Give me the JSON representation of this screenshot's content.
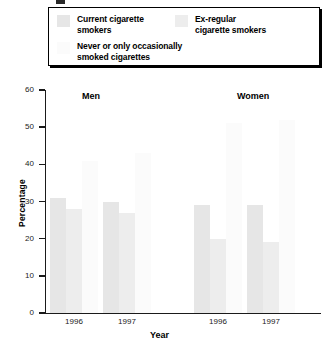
{
  "legend": {
    "items": [
      {
        "label": "Current cigarette\nsmokers",
        "color": "#e6e6e6",
        "name": "current-smokers"
      },
      {
        "label": "Ex-regular\ncigarette smokers",
        "color": "#ededed",
        "name": "ex-regular-smokers"
      },
      {
        "label": "Never or only occasionally\nsmoked cigarettes",
        "color": "#fbfbfb",
        "name": "never-smokers"
      }
    ]
  },
  "chart_data": {
    "type": "bar",
    "title": "",
    "xlabel": "Year",
    "ylabel": "Percentage",
    "ylim": [
      0,
      60
    ],
    "yticks": [
      0,
      10,
      20,
      30,
      40,
      50,
      60
    ],
    "grid": false,
    "legend_position": "top",
    "group_labels": [
      "Men",
      "Women"
    ],
    "categories": [
      "1996",
      "1997",
      "1996",
      "1997"
    ],
    "group_of_category": [
      "Men",
      "Men",
      "Women",
      "Women"
    ],
    "series": [
      {
        "name": "Current cigarette smokers",
        "color": "#e6e6e6",
        "values": [
          31,
          30,
          29,
          29
        ]
      },
      {
        "name": "Ex-regular cigarette smokers",
        "color": "#ededed",
        "values": [
          28,
          27,
          20,
          19
        ]
      },
      {
        "name": "Never or only occasionally smoked cigarettes",
        "color": "#fbfbfb",
        "values": [
          41,
          43,
          51,
          52
        ]
      }
    ]
  }
}
